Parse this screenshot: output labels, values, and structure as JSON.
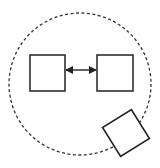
{
  "diagram": {
    "background": "#ffffff",
    "stroke_color": "#222222",
    "boundary": {
      "shape": "circle",
      "style": "dashed",
      "cx": 80,
      "cy": 84,
      "r": 71
    },
    "nodes": [
      {
        "id": "box-left",
        "shape": "square",
        "x": 30,
        "y": 55,
        "w": 35,
        "h": 36,
        "rotation": 0
      },
      {
        "id": "box-right",
        "shape": "square",
        "x": 97,
        "y": 55,
        "w": 36,
        "h": 36,
        "rotation": 0
      },
      {
        "id": "box-rotated",
        "shape": "square",
        "cx": 126,
        "cy": 133,
        "w": 34,
        "h": 34,
        "rotation": -32
      }
    ],
    "edges": [
      {
        "from": "box-left",
        "to": "box-right",
        "type": "bidirectional-arrow",
        "x1": 65,
        "y1": 70,
        "x2": 97,
        "y2": 70
      }
    ]
  }
}
